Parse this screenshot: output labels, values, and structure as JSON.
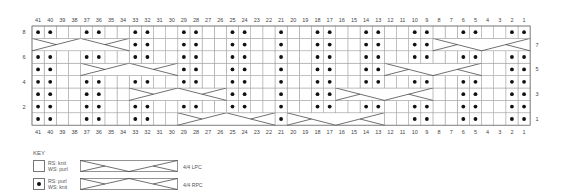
{
  "chart_data": {
    "type": "table",
    "columns": 41,
    "rows": 8,
    "column_labels": [
      41,
      40,
      39,
      38,
      37,
      36,
      35,
      34,
      33,
      32,
      31,
      30,
      29,
      28,
      27,
      26,
      25,
      24,
      23,
      22,
      21,
      20,
      19,
      18,
      17,
      16,
      15,
      14,
      13,
      12,
      11,
      10,
      9,
      8,
      7,
      6,
      5,
      4,
      3,
      2,
      1
    ],
    "left_row_labels": [
      8,
      6,
      4,
      2
    ],
    "right_row_labels": [
      7,
      5,
      3,
      1
    ],
    "row_data": {
      "8": {
        "purl": [
          41,
          40,
          37,
          36,
          33,
          32,
          29,
          28,
          25,
          24,
          21,
          18,
          17,
          14,
          13,
          10,
          9,
          6,
          5,
          2,
          1
        ],
        "cables": []
      },
      "7": {
        "purl": [
          33,
          32,
          29,
          28,
          25,
          24,
          21,
          18,
          17,
          14,
          13,
          10,
          9
        ],
        "cables": [
          {
            "from": 41,
            "to": 34,
            "type": "RPC"
          },
          {
            "from": 8,
            "to": 1,
            "type": "LPC"
          }
        ]
      },
      "6": {
        "purl": [
          41,
          40,
          37,
          36,
          33,
          32,
          29,
          28,
          25,
          24,
          21,
          18,
          17,
          14,
          13,
          10,
          9,
          6,
          5,
          2,
          1
        ],
        "cables": []
      },
      "5": {
        "purl": [
          41,
          40,
          29,
          28,
          25,
          24,
          21,
          18,
          17,
          14,
          13,
          2,
          1
        ],
        "cables": [
          {
            "from": 37,
            "to": 30,
            "type": "RPC"
          },
          {
            "from": 12,
            "to": 5,
            "type": "LPC"
          }
        ]
      },
      "4": {
        "purl": [
          41,
          40,
          37,
          36,
          33,
          32,
          29,
          28,
          25,
          24,
          21,
          18,
          17,
          14,
          13,
          10,
          9,
          6,
          5,
          2,
          1
        ],
        "cables": []
      },
      "3": {
        "purl": [
          41,
          40,
          37,
          36,
          25,
          24,
          21,
          18,
          17,
          6,
          5,
          2,
          1
        ],
        "cables": [
          {
            "from": 33,
            "to": 26,
            "type": "RPC"
          },
          {
            "from": 16,
            "to": 9,
            "type": "LPC"
          }
        ]
      },
      "2": {
        "purl": [
          41,
          40,
          37,
          36,
          33,
          32,
          29,
          28,
          25,
          24,
          21,
          18,
          17,
          14,
          13,
          10,
          9,
          6,
          5,
          2,
          1
        ],
        "cables": []
      },
      "1": {
        "purl": [
          41,
          40,
          37,
          36,
          33,
          32,
          21,
          10,
          9,
          6,
          5,
          2,
          1
        ],
        "cables": [
          {
            "from": 29,
            "to": 22,
            "type": "RPC"
          },
          {
            "from": 20,
            "to": 13,
            "type": "LPC"
          }
        ]
      }
    }
  },
  "key": {
    "title": "KEY",
    "knit": {
      "rs": "RS: knit",
      "ws": "WS: purl"
    },
    "purl": {
      "rs": "RS: purl",
      "ws": "WS: knit"
    },
    "lpc": "4/4 LPC",
    "rpc": "4/4 RPC"
  },
  "colors": {
    "grid": "#9a9a9a",
    "border": "#777777",
    "dot": "#111111",
    "line": "#333333"
  }
}
